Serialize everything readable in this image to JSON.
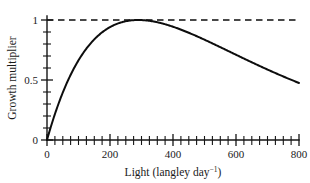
{
  "chart_data": {
    "type": "line",
    "title": "",
    "subtitle": "",
    "xlabel_main": "Light (langley day",
    "xlabel_sup": "−1",
    "xlabel_tail": ")",
    "xlabel_full": "Light (langley day⁻¹)",
    "ylabel": "Growth multiplier",
    "xlim": [
      0,
      800
    ],
    "ylim": [
      0,
      1.08
    ],
    "xticks_major": [
      0,
      200,
      400,
      600,
      800
    ],
    "xticklabels": [
      "0",
      "200",
      "400",
      "600",
      "800"
    ],
    "xtick_minor_step": 25,
    "yticks_major": [
      0,
      0.5,
      1
    ],
    "yticklabels": [
      "0",
      "0.5",
      "1"
    ],
    "ytick_minor_step": 0.1,
    "grid": false,
    "legend": null,
    "annotations": [
      {
        "name": "saturation-reference-line",
        "kind": "horizontal-dashed-line",
        "y": 1,
        "x_from": 0,
        "x_to": 800
      }
    ],
    "series": [
      {
        "name": "Growth multiplier vs light",
        "style": "solid",
        "color": "#0d0d0d",
        "model": "Steele photoinhibition: f(I) = (I/Iopt)*exp(1 - I/Iopt)",
        "i_opt": 290,
        "peak": {
          "x": 290,
          "y": 1.0
        },
        "x": [
          0,
          25,
          50,
          75,
          100,
          125,
          150,
          175,
          200,
          225,
          250,
          275,
          290,
          300,
          325,
          350,
          375,
          400,
          425,
          450,
          475,
          500,
          525,
          550,
          575,
          600,
          625,
          650,
          675,
          700,
          725,
          750,
          775,
          800
        ],
        "values": [
          0.0,
          0.2,
          0.37,
          0.52,
          0.65,
          0.76,
          0.85,
          0.91,
          0.96,
          0.99,
          1.0,
          1.0,
          1.0,
          1.0,
          0.99,
          0.98,
          0.96,
          0.94,
          0.91,
          0.88,
          0.85,
          0.82,
          0.79,
          0.76,
          0.73,
          0.69,
          0.66,
          0.63,
          0.61,
          0.58,
          0.56,
          0.54,
          0.52,
          0.5
        ]
      }
    ],
    "colors": {
      "curve": "#0d0d0d",
      "axis": "#151515",
      "background": "#ffffff",
      "reference_line": "#0d0d0d"
    }
  }
}
